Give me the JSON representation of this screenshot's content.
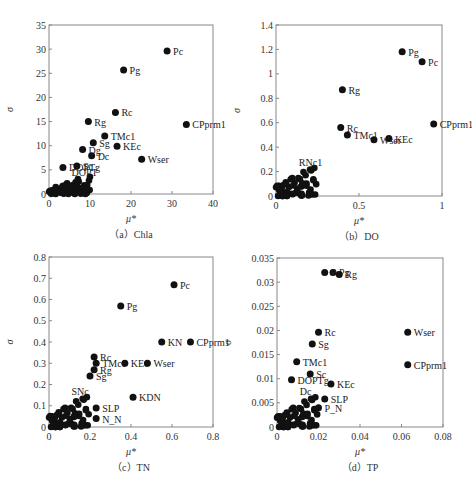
{
  "figure": {
    "panels": [
      {
        "id": "a",
        "caption": "（a）Chla"
      },
      {
        "id": "b",
        "caption": "（b）DO"
      },
      {
        "id": "c",
        "caption": "（c）TN"
      },
      {
        "id": "d",
        "caption": "（d）TP"
      }
    ],
    "xlabel": "μ*",
    "ylabel": "σ"
  },
  "chart_data": [
    {
      "type": "scatter",
      "title": "（a）Chla",
      "xlabel": "μ*",
      "ylabel": "σ",
      "xlim": [
        0,
        40
      ],
      "ylim": [
        0,
        35
      ],
      "xticks": [
        0,
        10,
        20,
        30,
        40
      ],
      "yticks": [
        0,
        5,
        10,
        15,
        20,
        25,
        30,
        35
      ],
      "grid": false,
      "frame": {
        "left": 49,
        "top": 25,
        "right": 213,
        "bottom": 194
      },
      "labeled_points": [
        {
          "label": "Pc",
          "x": 28.8,
          "y": 29.6
        },
        {
          "label": "Pg",
          "x": 18.2,
          "y": 25.7
        },
        {
          "label": "Rc",
          "x": 16.2,
          "y": 16.9
        },
        {
          "label": "CPprm1",
          "x": 33.5,
          "y": 14.4
        },
        {
          "label": "Rg",
          "x": 9.6,
          "y": 15.0
        },
        {
          "label": "TMc1",
          "x": 13.6,
          "y": 12.0
        },
        {
          "label": "Sg",
          "x": 10.8,
          "y": 10.6
        },
        {
          "label": "KEc",
          "x": 16.6,
          "y": 9.9
        },
        {
          "label": "Dg",
          "x": 8.2,
          "y": 9.2
        },
        {
          "label": "Dc",
          "x": 10.4,
          "y": 7.9
        },
        {
          "label": "Wser",
          "x": 22.6,
          "y": 7.2
        },
        {
          "label": "DOPTg",
          "x": 3.4,
          "y": 5.5
        },
        {
          "label": "Sc",
          "x": 6.8,
          "y": 5.8
        }
      ],
      "cluster_labels": [
        "DOPT"
      ],
      "cluster": {
        "x_range": [
          0,
          10
        ],
        "y_range": [
          0,
          4
        ],
        "count": 60
      }
    },
    {
      "type": "scatter",
      "title": "（b）DO",
      "xlabel": "μ*",
      "ylabel": "σ",
      "xlim": [
        0,
        1
      ],
      "ylim": [
        0,
        1.4
      ],
      "xticks": [
        0,
        0.5,
        1
      ],
      "yticks": [
        0,
        0.2,
        0.4,
        0.6,
        0.8,
        1,
        1.2,
        1.4
      ],
      "grid": false,
      "frame": {
        "left": 276,
        "top": 25,
        "right": 442,
        "bottom": 196
      },
      "labeled_points": [
        {
          "label": "Pg",
          "x": 0.76,
          "y": 1.18
        },
        {
          "label": "Pc",
          "x": 0.88,
          "y": 1.1
        },
        {
          "label": "Rg",
          "x": 0.4,
          "y": 0.87
        },
        {
          "label": "CPprm1",
          "x": 0.95,
          "y": 0.59
        },
        {
          "label": "Rc",
          "x": 0.39,
          "y": 0.56
        },
        {
          "label": "TMc1",
          "x": 0.43,
          "y": 0.5
        },
        {
          "label": "KEc",
          "x": 0.68,
          "y": 0.47
        },
        {
          "label": "Wser",
          "x": 0.59,
          "y": 0.46
        }
      ],
      "cluster_labels": [
        "RNc1"
      ],
      "cluster": {
        "x_range": [
          0,
          0.25
        ],
        "y_range": [
          0,
          0.26
        ],
        "count": 60
      }
    },
    {
      "type": "scatter",
      "title": "（c）TN",
      "xlabel": "μ*",
      "ylabel": "σ",
      "xlim": [
        0,
        0.8
      ],
      "ylim": [
        0,
        0.8
      ],
      "xticks": [
        0,
        0.2,
        0.4,
        0.6,
        0.8
      ],
      "yticks": [
        0,
        0.1,
        0.2,
        0.3,
        0.4,
        0.5,
        0.6,
        0.7,
        0.8
      ],
      "grid": false,
      "frame": {
        "left": 49,
        "top": 257,
        "right": 213,
        "bottom": 427
      },
      "labeled_points": [
        {
          "label": "Pc",
          "x": 0.61,
          "y": 0.67
        },
        {
          "label": "Pg",
          "x": 0.35,
          "y": 0.57
        },
        {
          "label": "KN",
          "x": 0.55,
          "y": 0.4
        },
        {
          "label": "CPprm1",
          "x": 0.69,
          "y": 0.4
        },
        {
          "label": "Rc",
          "x": 0.22,
          "y": 0.33
        },
        {
          "label": "TMc1",
          "x": 0.23,
          "y": 0.3
        },
        {
          "label": "KEc",
          "x": 0.37,
          "y": 0.3
        },
        {
          "label": "Wser",
          "x": 0.48,
          "y": 0.3
        },
        {
          "label": "Rg",
          "x": 0.22,
          "y": 0.27
        },
        {
          "label": "Sg",
          "x": 0.2,
          "y": 0.24
        },
        {
          "label": "KDN",
          "x": 0.41,
          "y": 0.14
        },
        {
          "label": "SLP",
          "x": 0.23,
          "y": 0.09
        },
        {
          "label": "N_N",
          "x": 0.23,
          "y": 0.04
        }
      ],
      "cluster_labels": [
        "SNc"
      ],
      "cluster": {
        "x_range": [
          0,
          0.2
        ],
        "y_range": [
          0,
          0.16
        ],
        "count": 60
      }
    },
    {
      "type": "scatter",
      "title": "（d）TP",
      "xlabel": "μ*",
      "ylabel": "σ",
      "xlim": [
        0,
        0.08
      ],
      "ylim": [
        0,
        0.035
      ],
      "xticks": [
        0,
        0.02,
        0.04,
        0.06,
        0.08
      ],
      "yticks": [
        0,
        0.005,
        0.01,
        0.015,
        0.02,
        0.025,
        0.03,
        0.035
      ],
      "grid": false,
      "frame": {
        "left": 277,
        "top": 258,
        "right": 443,
        "bottom": 427
      },
      "labeled_points": [
        {
          "label": "Pg",
          "x": 0.027,
          "y": 0.032
        },
        {
          "label": "Pc",
          "x": 0.023,
          "y": 0.032
        },
        {
          "label": "Rg",
          "x": 0.03,
          "y": 0.0316
        },
        {
          "label": "Rc",
          "x": 0.02,
          "y": 0.0196
        },
        {
          "label": "Wser",
          "x": 0.063,
          "y": 0.0196
        },
        {
          "label": "Sg",
          "x": 0.017,
          "y": 0.0172
        },
        {
          "label": "TMc1",
          "x": 0.0095,
          "y": 0.0135
        },
        {
          "label": "CPprm1",
          "x": 0.063,
          "y": 0.0129
        },
        {
          "label": "Sc",
          "x": 0.016,
          "y": 0.011
        },
        {
          "label": "DOPTg",
          "x": 0.007,
          "y": 0.0098
        },
        {
          "label": "KEc",
          "x": 0.026,
          "y": 0.0089
        },
        {
          "label": "SLP",
          "x": 0.023,
          "y": 0.0058
        },
        {
          "label": "P_N",
          "x": 0.02,
          "y": 0.004
        }
      ],
      "cluster_labels": [
        "Dc"
      ],
      "cluster": {
        "x_range": [
          0,
          0.02
        ],
        "y_range": [
          0,
          0.007
        ],
        "count": 60
      }
    }
  ]
}
